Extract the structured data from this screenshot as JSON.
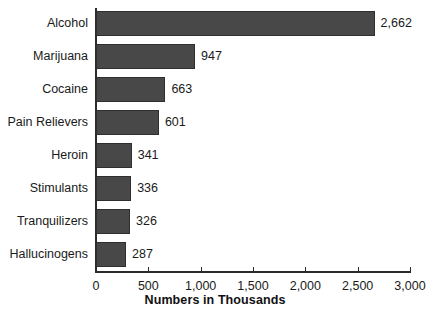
{
  "chart_data": {
    "type": "bar",
    "orientation": "horizontal",
    "title": "",
    "xlabel": "Numbers in Thousands",
    "ylabel": "",
    "categories": [
      "Alcohol",
      "Marijuana",
      "Cocaine",
      "Pain Relievers",
      "Heroin",
      "Stimulants",
      "Tranquilizers",
      "Hallucinogens"
    ],
    "values": [
      2662,
      947,
      663,
      601,
      341,
      336,
      326,
      287
    ],
    "value_labels": [
      "2,662",
      "947",
      "663",
      "601",
      "341",
      "336",
      "326",
      "287"
    ],
    "xlim": [
      0,
      3000
    ],
    "xticks": [
      0,
      500,
      1000,
      1500,
      2000,
      2500,
      3000
    ],
    "xtick_labels": [
      "0",
      "500",
      "1,000",
      "1,500",
      "2,000",
      "2,500",
      "3,000"
    ],
    "grid": false,
    "legend": false,
    "bar_color": "#484848",
    "bar_edge_color": "#2f2f2f",
    "axis_color": "#2b2b2b",
    "background": "#ffffff",
    "text_color": "#1a1a1a"
  }
}
